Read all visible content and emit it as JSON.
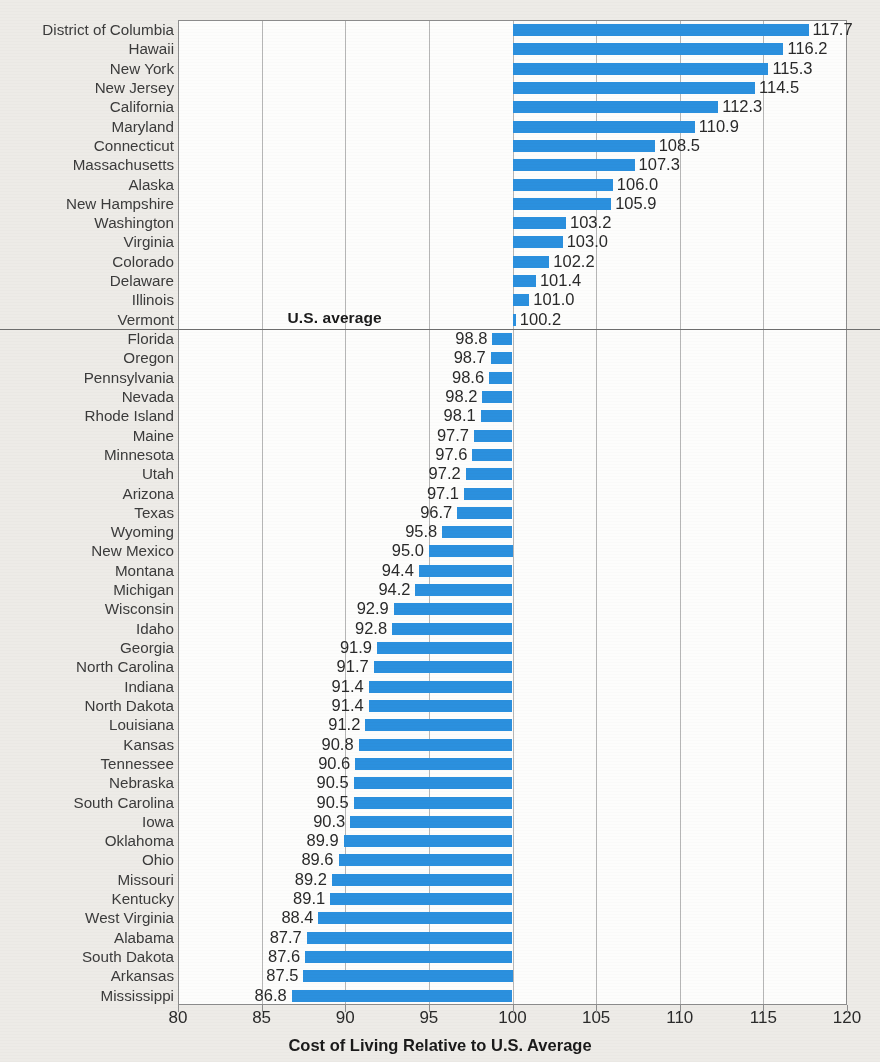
{
  "chart_data": {
    "type": "bar",
    "orientation": "horizontal",
    "title": "",
    "xlabel": "Cost of Living Relative to U.S. Average",
    "ylabel": "",
    "xlim": [
      80,
      120
    ],
    "xticks": [
      80,
      85,
      90,
      95,
      100,
      105,
      110,
      115,
      120
    ],
    "grid": true,
    "reference_line": {
      "value": 100,
      "label": "U.S. average"
    },
    "bar_color": "#2b90de",
    "categories": [
      "District of Columbia",
      "Hawaii",
      "New York",
      "New Jersey",
      "California",
      "Maryland",
      "Connecticut",
      "Massachusetts",
      "Alaska",
      "New Hampshire",
      "Washington",
      "Virginia",
      "Colorado",
      "Delaware",
      "Illinois",
      "Vermont",
      "Florida",
      "Oregon",
      "Pennsylvania",
      "Nevada",
      "Rhode Island",
      "Maine",
      "Minnesota",
      "Utah",
      "Arizona",
      "Texas",
      "Wyoming",
      "New Mexico",
      "Montana",
      "Michigan",
      "Wisconsin",
      "Idaho",
      "Georgia",
      "North Carolina",
      "Indiana",
      "North Dakota",
      "Louisiana",
      "Kansas",
      "Tennessee",
      "Nebraska",
      "South Carolina",
      "Iowa",
      "Oklahoma",
      "Ohio",
      "Missouri",
      "Kentucky",
      "West Virginia",
      "Alabama",
      "South Dakota",
      "Arkansas",
      "Mississippi"
    ],
    "values": [
      117.7,
      116.2,
      115.3,
      114.5,
      112.3,
      110.9,
      108.5,
      107.3,
      106.0,
      105.9,
      103.2,
      103.0,
      102.2,
      101.4,
      101.0,
      100.2,
      98.8,
      98.7,
      98.6,
      98.2,
      98.1,
      97.7,
      97.6,
      97.2,
      97.1,
      96.7,
      95.8,
      95.0,
      94.4,
      94.2,
      92.9,
      92.8,
      91.9,
      91.7,
      91.4,
      91.4,
      91.2,
      90.8,
      90.6,
      90.5,
      90.5,
      90.3,
      89.9,
      89.6,
      89.2,
      89.1,
      88.4,
      87.7,
      87.6,
      87.5,
      86.8
    ],
    "value_labels": [
      "117.7",
      "116.2",
      "115.3",
      "114.5",
      "112.3",
      "110.9",
      "108.5",
      "107.3",
      "106.0",
      "105.9",
      "103.2",
      "103.0",
      "102.2",
      "101.4",
      "101.0",
      "100.2",
      "98.8",
      "98.7",
      "98.6",
      "98.2",
      "98.1",
      "97.7",
      "97.6",
      "97.2",
      "97.1",
      "96.7",
      "95.8",
      "95.0",
      "94.4",
      "94.2",
      "92.9",
      "92.8",
      "91.9",
      "91.7",
      "91.4",
      "91.4",
      "91.2",
      "90.8",
      "90.6",
      "90.5",
      "90.5",
      "90.3",
      "89.9",
      "89.6",
      "89.2",
      "89.1",
      "88.4",
      "87.7",
      "87.6",
      "87.5",
      "86.8"
    ],
    "xtick_labels": [
      "80",
      "85",
      "90",
      "95",
      "100",
      "105",
      "110",
      "115",
      "120"
    ]
  }
}
